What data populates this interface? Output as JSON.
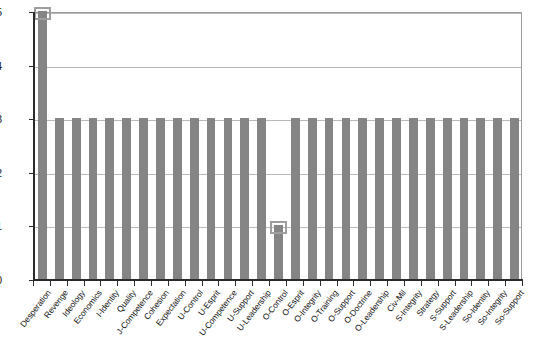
{
  "chart_data": {
    "type": "bar",
    "title": "",
    "subtitle": "",
    "xlabel": "",
    "ylabel": "",
    "ylim": [
      0,
      5
    ],
    "ytick_labels": [
      "0",
      "1",
      "2",
      "3",
      "4",
      "5"
    ],
    "yticks": [
      0,
      1,
      2,
      3,
      4,
      5
    ],
    "grid": true,
    "legend": "none",
    "bar_color": "#858585",
    "axis_color": "#2b2b2b",
    "gridline_color": "#b9b9b9",
    "plot_border_color": "#9a9a9a",
    "selection_color": "#9e9e9e",
    "categories": [
      "Desperation",
      "Revenge",
      "Ideology",
      "Economics",
      "I-Identity",
      "Quality",
      "J-Competence",
      "Cohesion",
      "Expectation",
      "U-Control",
      "U-Esprit",
      "U-Competence",
      "U-Support",
      "U-Leadership",
      "O-Control",
      "O-Esprit",
      "O-Integrity",
      "O-Training",
      "O-Support",
      "O-Doctrine",
      "O-Leadership",
      "Civ-Mil",
      "S-Integrity",
      "Strategy",
      "S-Support",
      "S-Leadership",
      "So-Identity",
      "So-Integrity",
      "So-Support"
    ],
    "values": [
      5,
      3,
      3,
      3,
      3,
      3,
      3,
      3,
      3,
      3,
      3,
      3,
      3,
      3,
      1,
      3,
      3,
      3,
      3,
      3,
      3,
      3,
      3,
      3,
      3,
      3,
      3,
      3,
      3
    ],
    "selected_categories": [
      "Desperation",
      "O-Control"
    ],
    "annotations": [
      {
        "category": "Desperation",
        "value": 5,
        "type": "selection-handle"
      },
      {
        "category": "O-Control",
        "value": 1,
        "type": "selection-handle"
      }
    ]
  }
}
